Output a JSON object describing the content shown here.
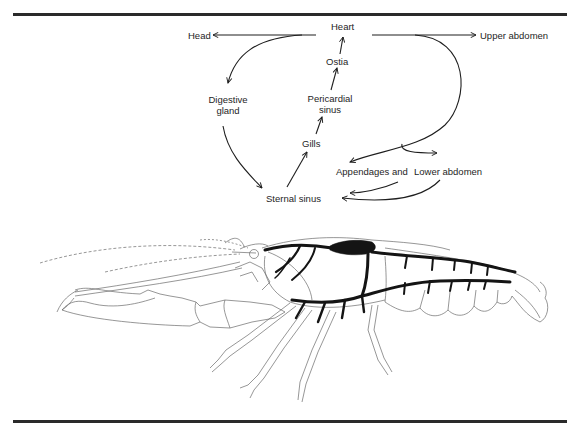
{
  "figure": {
    "nodes": {
      "heart": "Heart",
      "head": "Head",
      "upper_abdomen": "Upper abdomen",
      "ostia": "Ostia",
      "digestive_gland_line1": "Digestive",
      "digestive_gland_line2": "gland",
      "pericardial_sinus_line1": "Pericardial",
      "pericardial_sinus_line2": "sinus",
      "gills": "Gills",
      "appendages": "Appendages and",
      "lower_abdomen": "Lower abdomen",
      "sternal_sinus": "Sternal sinus"
    },
    "flows": [
      {
        "from": "Heart",
        "to": "Head"
      },
      {
        "from": "Heart",
        "to": "Digestive gland"
      },
      {
        "from": "Heart",
        "to": "Upper abdomen"
      },
      {
        "from": "Heart",
        "to": "Appendages"
      },
      {
        "from": "Heart",
        "to": "Lower abdomen"
      },
      {
        "from": "Digestive gland",
        "to": "Sternal sinus"
      },
      {
        "from": "Appendages",
        "to": "Sternal sinus"
      },
      {
        "from": "Lower abdomen",
        "to": "Sternal sinus"
      },
      {
        "from": "Sternal sinus",
        "to": "Gills"
      },
      {
        "from": "Gills",
        "to": "Pericardial sinus"
      },
      {
        "from": "Pericardial sinus",
        "to": "Ostia"
      },
      {
        "from": "Ostia",
        "to": "Heart"
      }
    ],
    "colors": {
      "ink": "#1e1e1e",
      "vessel": "#141414",
      "outline": "#6a6a6a",
      "rule": "#2a2a2a"
    }
  }
}
